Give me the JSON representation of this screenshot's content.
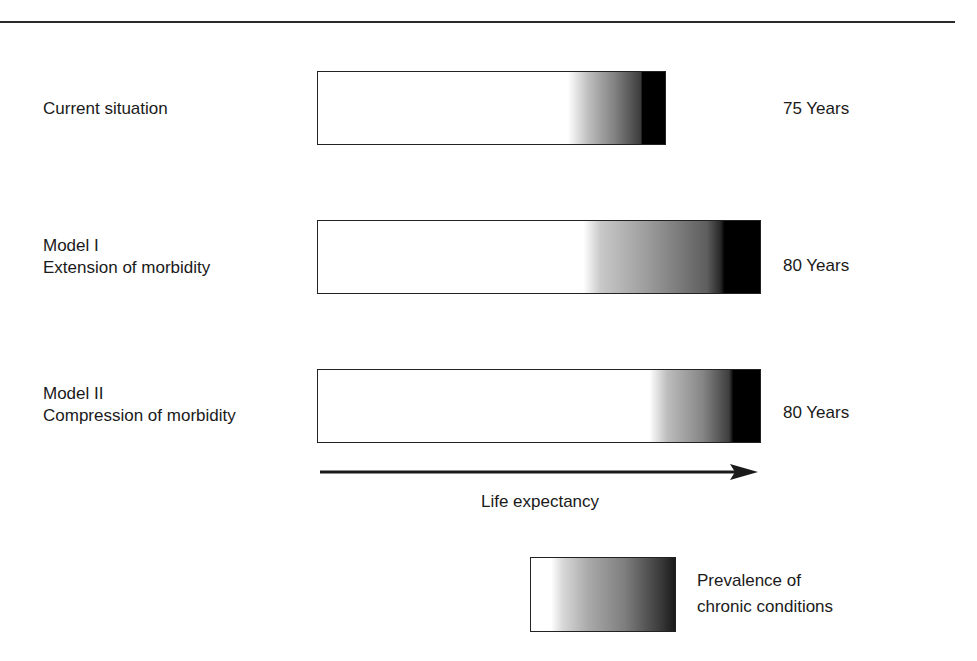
{
  "rows": [
    {
      "label_lines": [
        "Current situation"
      ],
      "years_label": "75 Years",
      "life_expectancy_years": 75,
      "bar": {
        "left": 317,
        "top": 71,
        "width": 349
      },
      "gradient": "linear-gradient(to right, #fff 0%, #fff 72%, #bdbdbd 78%, #7d7d7d 86%, #3c3c3c 93%, #000 93.5%, #000 100%)"
    },
    {
      "label_lines": [
        "Model I",
        "Extension of morbidity"
      ],
      "years_label": "80 Years",
      "life_expectancy_years": 80,
      "bar": {
        "left": 317,
        "top": 220,
        "width": 444
      },
      "gradient": "linear-gradient(to right, #fff 0%, #fff 60%, #c8c8c8 64%, #9a9a9a 75%, #5e5e5e 88%, #2a2a2a 91%, #000 92%, #000 100%)"
    },
    {
      "label_lines": [
        "Model II",
        "Compression of morbidity"
      ],
      "years_label": "80 Years",
      "life_expectancy_years": 80,
      "bar": {
        "left": 317,
        "top": 369,
        "width": 444
      },
      "gradient": "linear-gradient(to right, #fff 0%, #fff 75%, #bdbdbd 79%, #868686 87%, #3e3e3e 93%, #000 94%, #000 100%)"
    }
  ],
  "axis": {
    "label": "Life expectancy",
    "direction": "right"
  },
  "legend": {
    "lines": [
      "Prevalence of",
      "chronic conditions"
    ]
  },
  "colors": {
    "ink": "#1a1a1a",
    "bar_border": "#222222",
    "background": "#ffffff",
    "gradient_end": "#000000"
  }
}
